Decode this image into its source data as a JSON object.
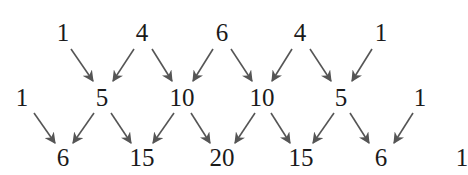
{
  "diagram": {
    "title": "",
    "rows": [
      {
        "name": "row-4",
        "y": 32,
        "values": [
          {
            "label": "1",
            "x": 63
          },
          {
            "label": "4",
            "x": 142
          },
          {
            "label": "6",
            "x": 222
          },
          {
            "label": "4",
            "x": 300
          },
          {
            "label": "1",
            "x": 381
          }
        ]
      },
      {
        "name": "row-5",
        "y": 97,
        "values": [
          {
            "label": "1",
            "x": 22
          },
          {
            "label": "5",
            "x": 102
          },
          {
            "label": "10",
            "x": 182
          },
          {
            "label": "10",
            "x": 262
          },
          {
            "label": "5",
            "x": 341
          },
          {
            "label": "1",
            "x": 420
          }
        ]
      },
      {
        "name": "row-6",
        "y": 157,
        "values": [
          {
            "label": "6",
            "x": 63
          },
          {
            "label": "15",
            "x": 142
          },
          {
            "label": "20",
            "x": 222
          },
          {
            "label": "15",
            "x": 301
          },
          {
            "label": "6",
            "x": 381
          },
          {
            "label": "1",
            "x": 462
          }
        ]
      }
    ],
    "arrow_color": "#555555",
    "arrows": [
      {
        "from": "row-4.0",
        "to": "row-5.1",
        "x1": 71,
        "y1": 49,
        "x2": 93,
        "y2": 81
      },
      {
        "from": "row-4.1",
        "to": "row-5.1",
        "x1": 134,
        "y1": 49,
        "x2": 113,
        "y2": 81
      },
      {
        "from": "row-4.1",
        "to": "row-5.2",
        "x1": 152,
        "y1": 49,
        "x2": 172,
        "y2": 81
      },
      {
        "from": "row-4.2",
        "to": "row-5.2",
        "x1": 213,
        "y1": 49,
        "x2": 193,
        "y2": 81
      },
      {
        "from": "row-4.2",
        "to": "row-5.3",
        "x1": 231,
        "y1": 49,
        "x2": 252,
        "y2": 81
      },
      {
        "from": "row-4.3",
        "to": "row-5.3",
        "x1": 292,
        "y1": 49,
        "x2": 272,
        "y2": 81
      },
      {
        "from": "row-4.3",
        "to": "row-5.4",
        "x1": 310,
        "y1": 49,
        "x2": 331,
        "y2": 81
      },
      {
        "from": "row-4.4",
        "to": "row-5.4",
        "x1": 372,
        "y1": 49,
        "x2": 352,
        "y2": 81
      },
      {
        "from": "row-5.0",
        "to": "row-6.0",
        "x1": 34,
        "y1": 113,
        "x2": 55,
        "y2": 143
      },
      {
        "from": "row-5.1",
        "to": "row-6.0",
        "x1": 94,
        "y1": 113,
        "x2": 73,
        "y2": 143
      },
      {
        "from": "row-5.1",
        "to": "row-6.1",
        "x1": 111,
        "y1": 113,
        "x2": 131,
        "y2": 143
      },
      {
        "from": "row-5.2",
        "to": "row-6.1",
        "x1": 174,
        "y1": 113,
        "x2": 153,
        "y2": 143
      },
      {
        "from": "row-5.2",
        "to": "row-6.2",
        "x1": 191,
        "y1": 113,
        "x2": 210,
        "y2": 143
      },
      {
        "from": "row-5.3",
        "to": "row-6.2",
        "x1": 255,
        "y1": 113,
        "x2": 235,
        "y2": 143
      },
      {
        "from": "row-5.3",
        "to": "row-6.3",
        "x1": 271,
        "y1": 113,
        "x2": 290,
        "y2": 143
      },
      {
        "from": "row-5.4",
        "to": "row-6.3",
        "x1": 334,
        "y1": 113,
        "x2": 313,
        "y2": 143
      },
      {
        "from": "row-5.4",
        "to": "row-6.4",
        "x1": 350,
        "y1": 113,
        "x2": 369,
        "y2": 143
      },
      {
        "from": "row-5.5",
        "to": "row-6.4",
        "x1": 413,
        "y1": 113,
        "x2": 394,
        "y2": 143
      }
    ]
  }
}
